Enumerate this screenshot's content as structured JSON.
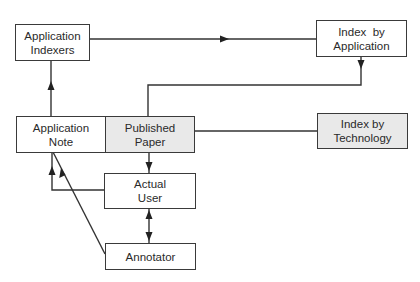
{
  "diagram": {
    "colors": {
      "line": "#333333",
      "box_border": "#3a3a3a",
      "shaded_fill": "#e9e9e9",
      "text": "#2a2a2a"
    },
    "nodes": {
      "application_indexers": {
        "line1": "Application",
        "line2": "Indexers"
      },
      "index_by_application": {
        "line1": "Index  by",
        "line2": "Application"
      },
      "application_note": {
        "line1": "Application",
        "line2": "Note"
      },
      "published_paper": {
        "line1": "Published",
        "line2": "Paper"
      },
      "index_by_technology": {
        "line1": "Index by",
        "line2": "Technology"
      },
      "actual_user": {
        "line1": "Actual",
        "line2": "User"
      },
      "annotator": {
        "line1": "Annotator"
      }
    },
    "edges": [
      {
        "from": "Application Indexers",
        "to": "Index by Application",
        "type": "arrow"
      },
      {
        "from": "Index by Application",
        "to": "Published Paper",
        "type": "arrow"
      },
      {
        "from": "Application Note",
        "to": "Application Indexers",
        "type": "arrow"
      },
      {
        "from": "Published Paper",
        "to": "Index by Technology",
        "type": "line"
      },
      {
        "from": "Published Paper",
        "to": "Actual User",
        "type": "arrow"
      },
      {
        "from": "Actual User",
        "to": "Application Note",
        "type": "arrow"
      },
      {
        "from": "Actual User",
        "to": "Annotator",
        "type": "bidirectional"
      },
      {
        "from": "Annotator",
        "to": "Application Note",
        "type": "arrow"
      }
    ]
  }
}
